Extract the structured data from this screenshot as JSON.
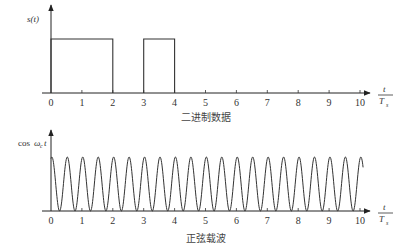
{
  "chart_data": [
    {
      "type": "line",
      "title": "",
      "caption": "二进制数据",
      "ylabel": "s(t)",
      "xlabel": "t/T_s",
      "xlabel_num": "t",
      "xlabel_den": "T",
      "xlabel_den_sub": "s",
      "x_ticks": [
        "0",
        "1",
        "2",
        "3",
        "4",
        "5",
        "6",
        "7",
        "8",
        "9",
        "10"
      ],
      "xlim": [
        0,
        10
      ],
      "ylim": [
        0,
        1
      ],
      "grid": false,
      "series": [
        {
          "name": "s(t)",
          "shape": "rectangular pulses",
          "pulses": [
            {
              "start": 0,
              "end": 2,
              "level": 1
            },
            {
              "start": 3,
              "end": 4,
              "level": 1
            }
          ]
        }
      ]
    },
    {
      "type": "line",
      "title": "",
      "caption": "正弦载波",
      "ylabel": "cosω_c t",
      "ylabel_base": "cos",
      "ylabel_omega": "ω",
      "ylabel_sub": "c",
      "ylabel_t": "t",
      "xlabel": "t/T_s",
      "xlabel_num": "t",
      "xlabel_den": "T",
      "xlabel_den_sub": "s",
      "x_ticks": [
        "0",
        "1",
        "2",
        "3",
        "4",
        "5",
        "6",
        "7",
        "8",
        "9",
        "10"
      ],
      "xlim": [
        0,
        10
      ],
      "grid": false,
      "series": [
        {
          "name": "carrier",
          "shape": "sinusoid",
          "cycles_per_Ts": 2,
          "x_end": 10.1
        }
      ]
    }
  ],
  "captions": {
    "top": "二进制数据",
    "bottom": "正弦载波"
  }
}
